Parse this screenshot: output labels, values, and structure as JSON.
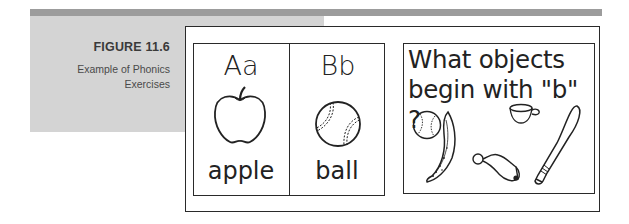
{
  "figure": {
    "number": "FIGURE 11.6",
    "caption_line1": "Example of Phonics",
    "caption_line2": "Exercises"
  },
  "cards": [
    {
      "letters": "Aa",
      "word": "apple",
      "icon": "apple-icon"
    },
    {
      "letters": "Bb",
      "word": "ball",
      "icon": "baseball-icon"
    }
  ],
  "exercise": {
    "question_line1": "What objects",
    "question_line2": "begin with \"b\" ?",
    "objects": [
      "baseball-icon",
      "banana-icon",
      "cup-icon",
      "bell-icon",
      "bat-icon"
    ]
  },
  "colors": {
    "top_bar": "#9c9c9c",
    "side_panel": "#d4d4d4",
    "ink": "#222222"
  }
}
